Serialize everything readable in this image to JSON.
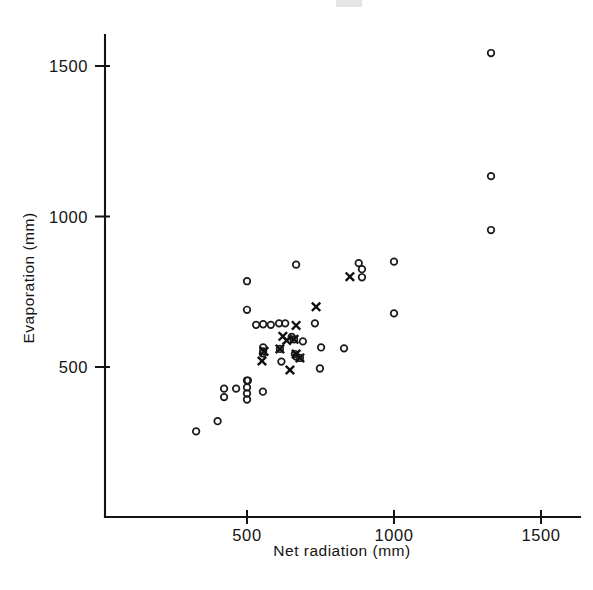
{
  "figure": {
    "name": "evaporation-vs-net-radiation-scatter",
    "background_color": "#ffffff",
    "ink_color": "#141414"
  },
  "chart_data": {
    "type": "scatter",
    "title": "",
    "xlabel": "Net  radiation (mm)",
    "ylabel": "Evaporation (mm)",
    "xlim": [
      0,
      1620
    ],
    "ylim": [
      0,
      1600
    ],
    "grid": false,
    "legend_position": "none",
    "xticks": [
      500,
      1000,
      1500
    ],
    "xtick_labels": [
      "500",
      "1000",
      "1500"
    ],
    "yticks": [
      500,
      1000,
      1500
    ],
    "ytick_labels": [
      "500",
      "1000",
      "1500"
    ],
    "series": [
      {
        "name": "open-circle",
        "marker": "circle",
        "color": "#1a1a1a",
        "points": [
          [
            327,
            286
          ],
          [
            400,
            320
          ],
          [
            422,
            400
          ],
          [
            422,
            428
          ],
          [
            463,
            428
          ],
          [
            500,
            455
          ],
          [
            500,
            432
          ],
          [
            500,
            412
          ],
          [
            500,
            392
          ],
          [
            500,
            785
          ],
          [
            500,
            690
          ],
          [
            503,
            455
          ],
          [
            531,
            640
          ],
          [
            555,
            642
          ],
          [
            554,
            418
          ],
          [
            555,
            552
          ],
          [
            554,
            545
          ],
          [
            555,
            565
          ],
          [
            581,
            640
          ],
          [
            609,
            645
          ],
          [
            612,
            560
          ],
          [
            617,
            518
          ],
          [
            630,
            645
          ],
          [
            652,
            600
          ],
          [
            660,
            592
          ],
          [
            663,
            543
          ],
          [
            667,
            535
          ],
          [
            667,
            840
          ],
          [
            680,
            530
          ],
          [
            690,
            585
          ],
          [
            731,
            645
          ],
          [
            748,
            495
          ],
          [
            752,
            565
          ],
          [
            830,
            562
          ],
          [
            880,
            845
          ],
          [
            891,
            825
          ],
          [
            891,
            798
          ],
          [
            1000,
            850
          ],
          [
            1000,
            678
          ],
          [
            1330,
            1543
          ],
          [
            1330,
            1134
          ],
          [
            1330,
            955
          ]
        ]
      },
      {
        "name": "cross",
        "marker": "x",
        "color": "#111111",
        "points": [
          [
            551,
            520
          ],
          [
            558,
            552
          ],
          [
            612,
            560
          ],
          [
            622,
            602
          ],
          [
            635,
            588
          ],
          [
            646,
            490
          ],
          [
            660,
            592
          ],
          [
            667,
            638
          ],
          [
            667,
            543
          ],
          [
            680,
            530
          ],
          [
            735,
            700
          ],
          [
            850,
            800
          ]
        ]
      }
    ]
  },
  "axes": {
    "x_axis_name": "net-radiation-axis",
    "y_axis_name": "evaporation-axis"
  }
}
